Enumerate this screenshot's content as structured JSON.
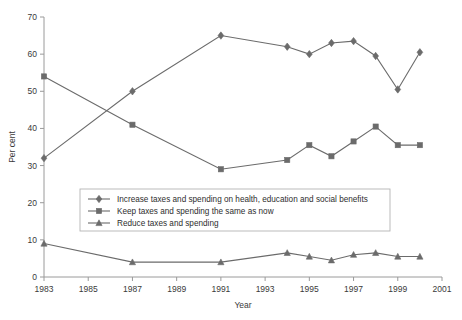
{
  "chart_data": {
    "type": "line",
    "title": "",
    "xlabel": "Year",
    "ylabel": "Per cent",
    "xlim": [
      1983,
      2001
    ],
    "ylim": [
      0,
      70
    ],
    "grid": false,
    "legend_position": "inside-center",
    "xticks": [
      1983,
      1985,
      1987,
      1989,
      1991,
      1993,
      1995,
      1997,
      1999,
      2001
    ],
    "yticks": [
      0,
      10,
      20,
      30,
      40,
      50,
      60,
      70
    ],
    "series": [
      {
        "name": "Increase taxes and spending on health, education and social benefits",
        "marker": "diamond",
        "color": "#6b6b6b",
        "x": [
          1983,
          1987,
          1991,
          1994,
          1995,
          1996,
          1997,
          1998,
          1999,
          2000
        ],
        "values": [
          32,
          50,
          65,
          62,
          60,
          63,
          63.5,
          59.5,
          50.5,
          60.5
        ]
      },
      {
        "name": "Keep taxes and spending the same as now",
        "marker": "square",
        "color": "#6b6b6b",
        "x": [
          1983,
          1987,
          1991,
          1994,
          1995,
          1996,
          1997,
          1998,
          1999,
          2000
        ],
        "values": [
          54,
          41,
          29,
          31.5,
          35.5,
          32.5,
          36.5,
          40.5,
          35.5,
          35.5
        ]
      },
      {
        "name": "Reduce taxes and spending",
        "marker": "triangle",
        "color": "#6b6b6b",
        "x": [
          1983,
          1987,
          1991,
          1994,
          1995,
          1996,
          1997,
          1998,
          1999,
          2000
        ],
        "values": [
          9,
          4,
          4,
          6.5,
          5.5,
          4.5,
          6,
          6.5,
          5.5,
          5.5
        ]
      }
    ]
  },
  "axes": {
    "y_title": "Per cent",
    "x_title": "Year",
    "y_tick_labels": [
      "0",
      "10",
      "20",
      "30",
      "40",
      "50",
      "60",
      "70"
    ],
    "x_tick_labels": [
      "1983",
      "1985",
      "1987",
      "1989",
      "1991",
      "1993",
      "1995",
      "1997",
      "1999",
      "2001"
    ]
  },
  "legend": {
    "entries": [
      {
        "label": "Increase taxes and spending on health, education and social benefits",
        "marker": "diamond"
      },
      {
        "label": "Keep taxes and spending the same as now",
        "marker": "square"
      },
      {
        "label": "Reduce taxes and spending",
        "marker": "triangle"
      }
    ]
  },
  "colors": {
    "series": "#6b6b6b",
    "axis": "#9a9a9a",
    "text": "#3a3a3a",
    "legend_border": "#b4b4b4"
  }
}
